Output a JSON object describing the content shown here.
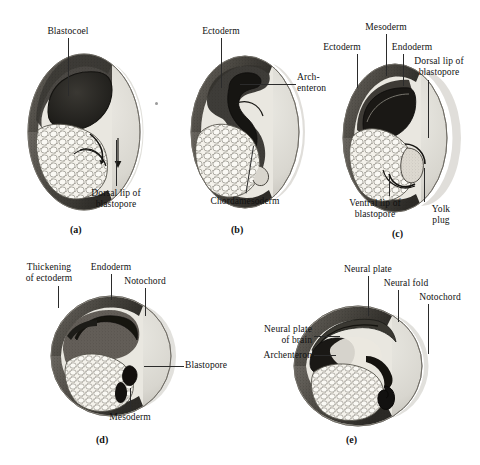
{
  "figure": {
    "background_color": "#ffffff",
    "ink_color": "#111111",
    "panel_count": 5
  },
  "panels": [
    {
      "letter": "(a)",
      "labels": [
        {
          "text": "Blastocoel"
        },
        {
          "text": "Dorsal lip of\nblastopore"
        }
      ]
    },
    {
      "letter": "(b)",
      "labels": [
        {
          "text": "Ectoderm"
        },
        {
          "text": "Arch-\nenteron"
        },
        {
          "text": "Chordamesoderm"
        }
      ]
    },
    {
      "letter": "(c)",
      "labels": [
        {
          "text": "Mesoderm"
        },
        {
          "text": "Ectoderm"
        },
        {
          "text": "Endoderm"
        },
        {
          "text": "Dorsal lip of\nblastopore"
        },
        {
          "text": "Ventral lip of\nblastopore"
        },
        {
          "text": "Yolk\nplug"
        }
      ]
    },
    {
      "letter": "(d)",
      "labels": [
        {
          "text": "Thickening\nof ectoderm"
        },
        {
          "text": "Endoderm"
        },
        {
          "text": "Notochord"
        },
        {
          "text": "Blastopore"
        },
        {
          "text": "Mesoderm"
        }
      ]
    },
    {
      "letter": "(e)",
      "labels": [
        {
          "text": "Neural plate"
        },
        {
          "text": "Neural fold"
        },
        {
          "text": "Notochord"
        },
        {
          "text": "Neural plate\nof brain"
        },
        {
          "text": "Archenteron"
        }
      ]
    }
  ],
  "colors": {
    "outer_shell": "#d8d6cf",
    "shell_shadow": "#bdbab2",
    "ectoderm_dark": "#4a4742",
    "cavity_dark": "#23211e",
    "yolk_pale": "#f2f0e9",
    "yolk_outline": "#6b6860",
    "leader_line": "#2b2b2b"
  }
}
